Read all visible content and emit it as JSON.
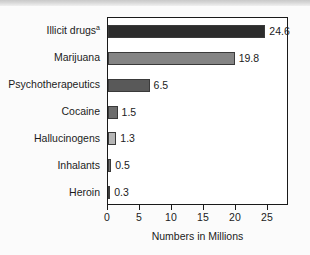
{
  "chart_data": {
    "type": "bar",
    "orientation": "horizontal",
    "title": "",
    "xlabel": "Numbers in Millions",
    "ylabel": "",
    "categories": [
      "Illicit drugs",
      "Marijuana",
      "Psychotherapeutics",
      "Cocaine",
      "Hallucinogens",
      "Inhalants",
      "Heroin"
    ],
    "category_footnote_markers": [
      "a",
      "",
      "",
      "",
      "",
      "",
      ""
    ],
    "values": [
      24.6,
      19.8,
      6.5,
      1.5,
      1.3,
      0.5,
      0.3
    ],
    "value_labels": [
      "24.6",
      "19.8",
      "6.5",
      "1.5",
      "1.3",
      "0.5",
      "0.3"
    ],
    "bar_colors": [
      "#2c2c2c",
      "#848484",
      "#595959",
      "#6d6d6d",
      "#b6b6b6",
      "#6f6f6f",
      "#4a4a4a"
    ],
    "xlim": [
      0,
      28.3
    ],
    "xticks": [
      0,
      5,
      10,
      15,
      20,
      25
    ],
    "xtick_labels": [
      "0",
      "5",
      "10",
      "15",
      "20",
      "25"
    ],
    "grid": false,
    "legend": "none",
    "frame_color": "#1a1a1a",
    "background_color": "#ffffff"
  }
}
